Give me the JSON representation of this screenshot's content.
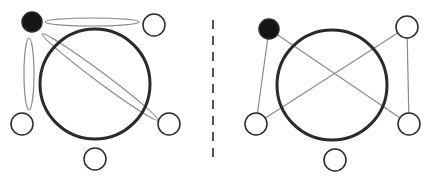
{
  "colors": {
    "background": "#ffffff",
    "stroke_main": "#2a2a2a",
    "stroke_thin": "#8a8a8a",
    "node_fill_filled": "#151515",
    "node_fill_empty": "#ffffff",
    "divider": "#555555"
  },
  "panels": [
    {
      "id": "left",
      "description": "Hypergraph view: pairwise relations shown as thin ellipses enclosing node pairs",
      "central_circle": {
        "cx": 95,
        "cy": 84,
        "r": 55
      },
      "nodes": [
        {
          "id": "A",
          "cx": 32,
          "cy": 22,
          "r": 10,
          "filled": true
        },
        {
          "id": "B",
          "cx": 154,
          "cy": 25,
          "r": 11,
          "filled": false
        },
        {
          "id": "C",
          "cx": 22,
          "cy": 124,
          "r": 11,
          "filled": false
        },
        {
          "id": "D",
          "cx": 169,
          "cy": 124,
          "r": 11,
          "filled": false
        },
        {
          "id": "E",
          "cx": 95,
          "cy": 159,
          "r": 11,
          "filled": false
        }
      ],
      "ellipses": [
        {
          "id": "A-B",
          "cx": 92,
          "cy": 22,
          "rx": 47,
          "ry": 4,
          "angle": 0
        },
        {
          "id": "A-C",
          "cx": 29,
          "cy": 74,
          "rx": 5,
          "ry": 36,
          "angle": 0
        },
        {
          "id": "A-D",
          "cx": 100,
          "cy": 77,
          "rx": 72,
          "ry": 5,
          "angle": 36.7
        }
      ]
    },
    {
      "id": "right",
      "description": "Graph view: pairwise relations shown as straight edges between nodes",
      "central_circle": {
        "cx": 332,
        "cy": 85,
        "r": 55
      },
      "nodes": [
        {
          "id": "A",
          "cx": 269,
          "cy": 29,
          "r": 10,
          "filled": true
        },
        {
          "id": "B",
          "cx": 407,
          "cy": 27,
          "r": 11,
          "filled": false
        },
        {
          "id": "C",
          "cx": 256,
          "cy": 124,
          "r": 11,
          "filled": false
        },
        {
          "id": "D",
          "cx": 409,
          "cy": 124,
          "r": 11,
          "filled": false
        },
        {
          "id": "E",
          "cx": 335,
          "cy": 160,
          "r": 11,
          "filled": false
        }
      ],
      "edges": [
        {
          "from": "A",
          "to": "C"
        },
        {
          "from": "A",
          "to": "D"
        },
        {
          "from": "B",
          "to": "C"
        },
        {
          "from": "B",
          "to": "D"
        }
      ]
    }
  ],
  "divider": {
    "x": 213,
    "y1": 20,
    "y2": 163,
    "dash": "9,7"
  }
}
